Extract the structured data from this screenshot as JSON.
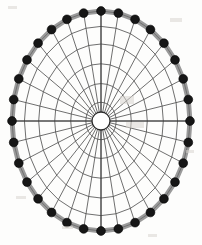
{
  "figure": {
    "name": "radial-wheel-diagram",
    "title": "Elliptical spoked wheel with beaded rim",
    "canvas": {
      "width": 202,
      "height": 245
    },
    "background_color": "#fdfdfc"
  },
  "chart_data": {
    "type": "scatter",
    "title": "Elliptical spoked wheel with beaded rim",
    "xlabel": "",
    "ylabel": "",
    "coordinate_system": "polar-elliptical",
    "center": {
      "cx": 101,
      "cy": 121
    },
    "outer_radius": {
      "rx": 89,
      "ry": 110
    },
    "spoke_count": 32,
    "bead_count": 32,
    "ring_count": 5,
    "ring_radii_fraction": [
      0.17,
      0.34,
      0.52,
      0.7,
      0.86
    ],
    "hub_radius": {
      "rx": 9,
      "ry": 9
    },
    "angle_step_degrees": 11.25,
    "grid": true,
    "legend": false
  },
  "style": {
    "rim_band_color": "#9a9a9a",
    "rim_band_width": 5,
    "rim_inner_line_color": "#5d5d5d",
    "bead_fill": "#161616",
    "bead_stroke": "#000000",
    "bead_radius": 4.4,
    "spoke_color": "#4a4a4a",
    "spoke_width": 0.8,
    "ring_color": "#4a4a4a",
    "ring_width": 0.8,
    "hub_stroke": "#2b2b2b",
    "hub_fill": "#ffffff",
    "hub_width": 1.3
  },
  "axes": {
    "vertical_axis_visible": true,
    "horizontal_axis_visible": true,
    "axis_color": "#3a3a3a"
  },
  "artifacts": [
    {
      "x": 8,
      "y": 6,
      "w": 9,
      "h": 3
    },
    {
      "x": 170,
      "y": 18,
      "w": 12,
      "h": 4
    },
    {
      "x": 16,
      "y": 196,
      "w": 10,
      "h": 3
    },
    {
      "x": 186,
      "y": 150,
      "w": 8,
      "h": 3
    },
    {
      "x": 120,
      "y": 96,
      "w": 14,
      "h": 8
    },
    {
      "x": 126,
      "y": 122,
      "w": 18,
      "h": 6
    },
    {
      "x": 62,
      "y": 226,
      "w": 11,
      "h": 3
    },
    {
      "x": 148,
      "y": 234,
      "w": 9,
      "h": 3
    }
  ]
}
